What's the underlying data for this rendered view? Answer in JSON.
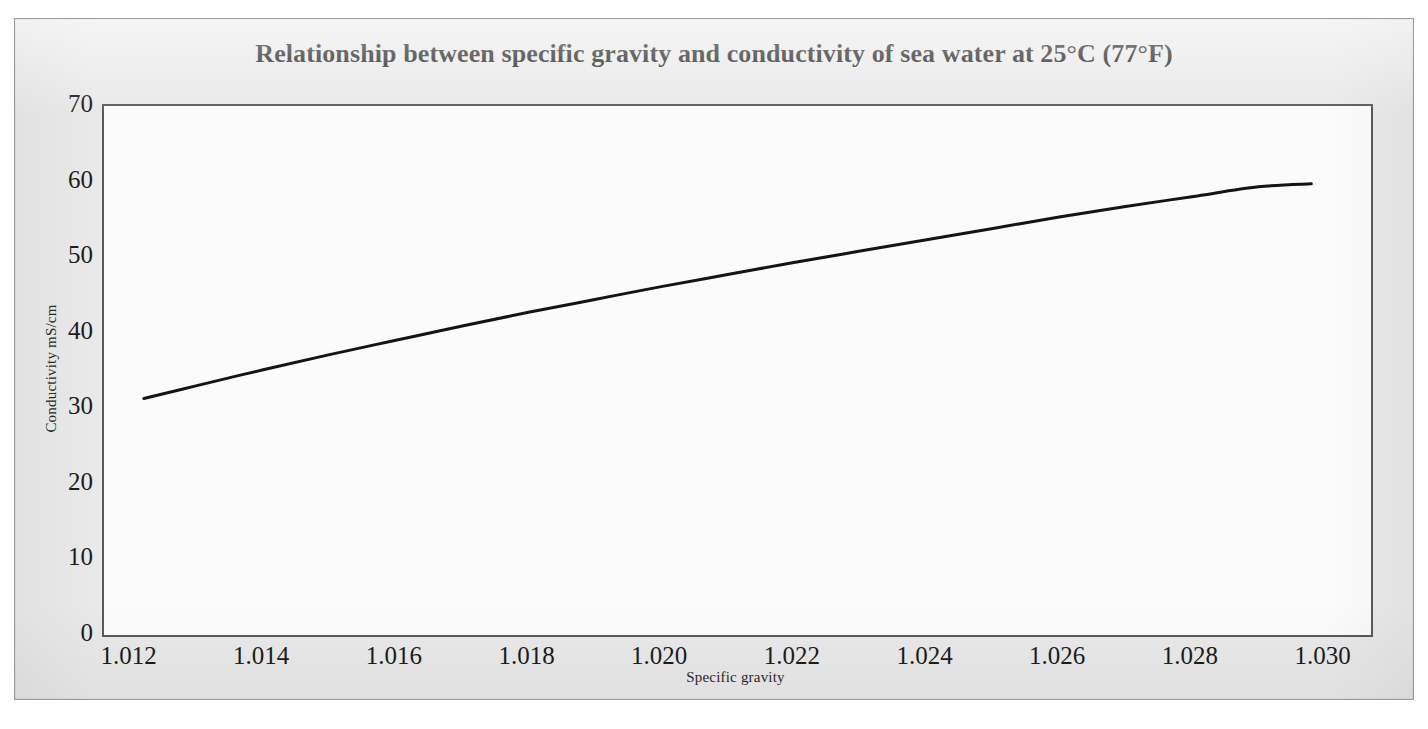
{
  "figure": {
    "title": "Relationship between specific gravity and conductivity of sea water at 25°C (77°F)",
    "background_color": "#e9e9e9",
    "plot_background_color": "#fbfbfb",
    "frame_color": "#5a5a5a",
    "curve_color": "#141414"
  },
  "chart_data": {
    "type": "line",
    "title": "Relationship between specific gravity and conductivity of sea water at 25°C (77°F)",
    "xlabel": "Specific gravity",
    "ylabel": "Conductivity mS/cm",
    "xlim": [
      1.0116,
      1.0307
    ],
    "ylim": [
      0,
      70
    ],
    "grid": false,
    "legend": false,
    "xticks": [
      "1.012",
      "1.014",
      "1.016",
      "1.018",
      "1.020",
      "1.022",
      "1.024",
      "1.026",
      "1.028",
      "1.030"
    ],
    "xtick_values": [
      1.012,
      1.014,
      1.016,
      1.018,
      1.02,
      1.022,
      1.024,
      1.026,
      1.028,
      1.03
    ],
    "yticks": [
      "0",
      "10",
      "20",
      "30",
      "40",
      "50",
      "60",
      "70"
    ],
    "ytick_values": [
      0,
      10,
      20,
      30,
      40,
      50,
      60,
      70
    ],
    "series": [
      {
        "name": "Conductivity of sea water at 25°C",
        "color": "#141414",
        "x": [
          1.0122,
          1.013,
          1.014,
          1.015,
          1.016,
          1.017,
          1.018,
          1.019,
          1.02,
          1.021,
          1.022,
          1.023,
          1.024,
          1.025,
          1.026,
          1.027,
          1.028,
          1.029,
          1.0298
        ],
        "y": [
          31.3,
          33.0,
          35.1,
          37.1,
          39.0,
          40.9,
          42.7,
          44.4,
          46.1,
          47.7,
          49.3,
          50.8,
          52.3,
          53.8,
          55.3,
          56.7,
          58.0,
          59.3,
          59.7
        ]
      }
    ]
  }
}
